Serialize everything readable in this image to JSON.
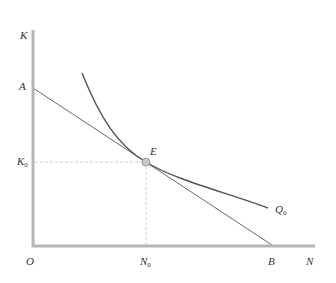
{
  "diagram": {
    "type": "isoquant-isocost",
    "colors": {
      "axis": "#b5b5b5",
      "curve": "#555555",
      "line": "#6a6a6a",
      "guide": "#cccccc",
      "point_fill": "#c8c8c8",
      "point_stroke": "#8a8a8a"
    },
    "axes": {
      "y_label": "K",
      "x_label": "N",
      "origin_label": "O"
    },
    "points": {
      "A": "A",
      "B": "B",
      "E": "E"
    },
    "ticks": {
      "k0": {
        "main": "K",
        "sub": "0"
      },
      "n0": {
        "main": "N",
        "sub": "0"
      }
    },
    "curve_label": {
      "main": "Q",
      "sub": "0"
    }
  }
}
